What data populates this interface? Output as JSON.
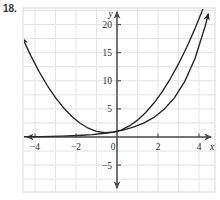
{
  "figure": {
    "problem_number": "18.",
    "background_color": "#ffffff",
    "frame_color": "#d8d8d8",
    "grid_color": "#e3e3e3",
    "axis_color": "#4a4a4a",
    "curve_color": "#262626"
  },
  "axes": {
    "x_label": "x",
    "y_label": "y",
    "x_ticks": [
      {
        "value": -4,
        "label": "−4"
      },
      {
        "value": -2,
        "label": "−2"
      },
      {
        "value": 2,
        "label": "2"
      },
      {
        "value": 4,
        "label": "4"
      }
    ],
    "y_ticks": [
      {
        "value": 20,
        "label": "20"
      },
      {
        "value": 15,
        "label": "15"
      },
      {
        "value": 10,
        "label": "10"
      },
      {
        "value": 5,
        "label": "5"
      },
      {
        "value": -5,
        "label": "−5"
      }
    ],
    "origin_label": "0"
  },
  "chart_data": {
    "type": "line",
    "title": "",
    "xlabel": "x",
    "ylabel": "y",
    "xlim": [
      -4.8,
      4.9
    ],
    "ylim": [
      -6.2,
      21.8
    ],
    "grid": true,
    "grid_step_x": 1,
    "grid_step_y": 2.5,
    "legend": "none",
    "series": [
      {
        "name": "parabola",
        "expression": "y = x^2 + x + 1",
        "arrowheads": [
          "start",
          "end"
        ],
        "x": [
          -4.6,
          -4.2,
          -3.8,
          -3.4,
          -3.0,
          -2.6,
          -2.2,
          -1.8,
          -1.4,
          -1.0,
          -0.6,
          -0.2,
          0.2,
          0.6,
          1.0,
          1.4,
          1.8,
          2.2,
          2.6,
          3.0,
          3.4,
          3.8,
          4.2,
          4.45
        ],
        "y": [
          17.56,
          14.44,
          11.64,
          9.16,
          7.0,
          5.16,
          3.64,
          2.44,
          1.56,
          1.0,
          0.76,
          0.84,
          1.24,
          1.96,
          3.0,
          4.36,
          6.04,
          8.04,
          10.36,
          13.0,
          15.96,
          19.24,
          22.84,
          25.25
        ]
      },
      {
        "name": "exponential",
        "expression": "y = 2^x",
        "arrowheads": [
          "end"
        ],
        "x": [
          -4.7,
          -4.2,
          -3.7,
          -3.2,
          -2.7,
          -2.2,
          -1.7,
          -1.2,
          -0.7,
          -0.2,
          0.3,
          0.8,
          1.3,
          1.8,
          2.3,
          2.8,
          3.3,
          3.8,
          4.3,
          4.45
        ],
        "y": [
          0.038,
          0.054,
          0.077,
          0.109,
          0.154,
          0.218,
          0.308,
          0.435,
          0.616,
          0.871,
          1.231,
          1.741,
          2.462,
          3.482,
          4.925,
          6.964,
          9.849,
          13.93,
          19.7,
          21.87
        ]
      }
    ]
  }
}
